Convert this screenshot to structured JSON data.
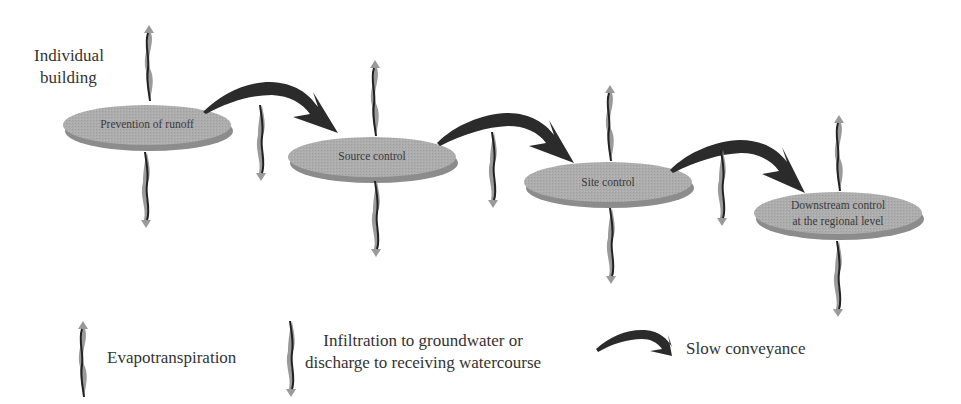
{
  "header": {
    "start_label_line1": "Individual",
    "start_label_line2": "building"
  },
  "nodes": [
    {
      "label": "Prevention of runoff"
    },
    {
      "label": "Source control"
    },
    {
      "label": "Site control"
    },
    {
      "label_line1": "Downstream control",
      "label_line2": "at the regional level"
    }
  ],
  "legend": {
    "evapotranspiration": "Evapotranspiration",
    "infiltration_line1": "Infiltration to groundwater or",
    "infiltration_line2": "discharge to receiving watercourse",
    "conveyance": "Slow conveyance"
  },
  "colors": {
    "ellipse_fill": "#a9a9a9",
    "ellipse_edge": "#8a8a8a",
    "arrow": "#2b2b2b",
    "wavy_light": "#9a9a9a",
    "wavy_dark": "#222222"
  }
}
